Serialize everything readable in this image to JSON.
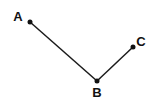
{
  "diagram": {
    "type": "angle",
    "line_color": "#1a1a1a",
    "points": [
      {
        "id": "A",
        "label": "A",
        "x": 30,
        "y": 22,
        "label_x": 18,
        "label_y": 21
      },
      {
        "id": "B",
        "label": "B",
        "x": 97,
        "y": 81,
        "label_x": 97,
        "label_y": 97
      },
      {
        "id": "C",
        "label": "C",
        "x": 133,
        "y": 47,
        "label_x": 141,
        "label_y": 46
      }
    ],
    "segments": [
      {
        "from": "A",
        "to": "B"
      },
      {
        "from": "B",
        "to": "C"
      }
    ]
  }
}
